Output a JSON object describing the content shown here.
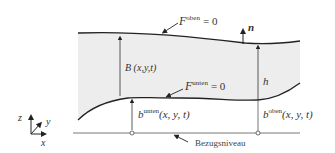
{
  "diagram": {
    "labels": {
      "F_oben_base": "F",
      "F_oben_sup": "oben",
      "F_oben_eq": "= 0",
      "F_unten_base": "F",
      "F_unten_sup": "unten",
      "F_unten_eq": "= 0",
      "normal": "n",
      "B": "B (x,y,t)",
      "h": "h",
      "b_unten_base": "b",
      "b_unten_sup": "unten",
      "b_unten_args": "(x, y, t)",
      "b_oben_base": "b",
      "b_oben_sup": "oben",
      "b_oben_args": "(x, y, t)",
      "reference": "Bezugsniveau",
      "axis_z": "z",
      "axis_y": "y",
      "axis_x": "x"
    },
    "colors": {
      "fill": "#ededed",
      "line": "#222222",
      "thin_line": "#555555"
    }
  }
}
